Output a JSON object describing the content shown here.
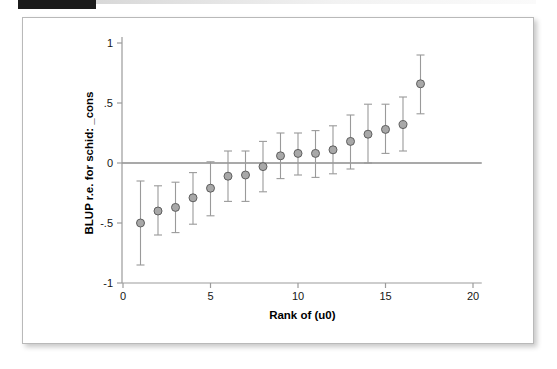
{
  "figure": {
    "redaction_label": "",
    "background_color": "#ffffff",
    "border_color": "#b9b9b9"
  },
  "chart_data": {
    "type": "scatter",
    "title": "",
    "subtitle": "",
    "xlabel": "Rank of (u0)",
    "ylabel": "BLUP r.e. for schid: _cons",
    "xlim": [
      0,
      20.5
    ],
    "ylim": [
      -1.05,
      1.05
    ],
    "xticks": [
      0,
      5,
      10,
      15,
      20
    ],
    "xtick_labels": [
      "0",
      "5",
      "10",
      "15",
      "20"
    ],
    "yticks": [
      1,
      0.5,
      0,
      -0.5,
      -1
    ],
    "ytick_labels": [
      "1",
      ".5",
      "0",
      "-.5",
      "-1"
    ],
    "grid": false,
    "legend": null,
    "reference_line": {
      "y": 0,
      "color": "#8c8c8c"
    },
    "marker": {
      "shape": "circle",
      "fill_color": "#a8a8a8",
      "edge_color": "#5e5e5e",
      "size": 8
    },
    "errorbar": {
      "color": "#9a9a9a",
      "cap": true
    },
    "x": [
      1,
      2,
      3,
      4,
      5,
      6,
      7,
      8,
      9,
      10,
      11,
      12,
      13,
      14,
      15,
      16,
      17
    ],
    "values": [
      -0.5,
      -0.4,
      -0.37,
      -0.29,
      -0.21,
      -0.11,
      -0.1,
      -0.03,
      0.06,
      0.08,
      0.08,
      0.11,
      0.18,
      0.24,
      0.28,
      0.32,
      0.66
    ],
    "ci_lower": [
      -0.85,
      -0.6,
      -0.58,
      -0.51,
      -0.44,
      -0.32,
      -0.32,
      -0.24,
      -0.13,
      -0.1,
      -0.12,
      -0.09,
      -0.05,
      0.0,
      0.08,
      0.1,
      0.41
    ],
    "ci_upper": [
      -0.15,
      -0.19,
      -0.16,
      -0.08,
      0.01,
      0.1,
      0.1,
      0.18,
      0.25,
      0.25,
      0.27,
      0.31,
      0.4,
      0.49,
      0.49,
      0.55,
      0.9
    ],
    "series_name": "BLUP random effect"
  }
}
